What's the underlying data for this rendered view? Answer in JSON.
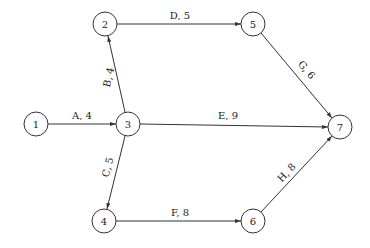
{
  "diagram": {
    "type": "activity-on-arrow network",
    "nodes": [
      {
        "id": "1",
        "label": "1",
        "x": 36,
        "y": 124
      },
      {
        "id": "2",
        "label": "2",
        "x": 105,
        "y": 24
      },
      {
        "id": "3",
        "label": "3",
        "x": 128,
        "y": 124
      },
      {
        "id": "4",
        "label": "4",
        "x": 104,
        "y": 221
      },
      {
        "id": "5",
        "label": "5",
        "x": 253,
        "y": 24
      },
      {
        "id": "6",
        "label": "6",
        "x": 253,
        "y": 221
      },
      {
        "id": "7",
        "label": "7",
        "x": 340,
        "y": 127
      }
    ],
    "edges": [
      {
        "from": "1",
        "to": "3",
        "activity": "A",
        "duration": 4,
        "label": "A, 4"
      },
      {
        "from": "3",
        "to": "2",
        "activity": "B",
        "duration": 4,
        "label": "B, 4"
      },
      {
        "from": "3",
        "to": "4",
        "activity": "C",
        "duration": 5,
        "label": "C, 5"
      },
      {
        "from": "2",
        "to": "5",
        "activity": "D",
        "duration": 5,
        "label": "D, 5"
      },
      {
        "from": "3",
        "to": "7",
        "activity": "E",
        "duration": 9,
        "label": "E, 9"
      },
      {
        "from": "4",
        "to": "6",
        "activity": "F",
        "duration": 8,
        "label": "F, 8"
      },
      {
        "from": "5",
        "to": "7",
        "activity": "G",
        "duration": 6,
        "label": "G, 6"
      },
      {
        "from": "6",
        "to": "7",
        "activity": "H",
        "duration": 8,
        "label": "H, 8"
      }
    ]
  }
}
